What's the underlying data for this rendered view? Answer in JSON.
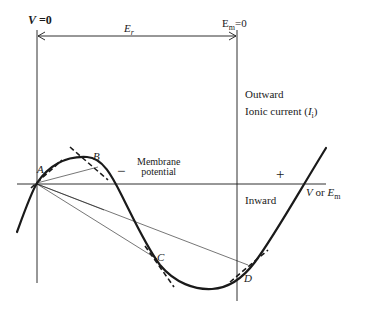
{
  "diagram": {
    "title": "",
    "labels": {
      "v_zero": "V =0",
      "v_zero_symbol": "V",
      "v_zero_rest": " =0",
      "em_zero_main": "E",
      "em_zero_sub": "m",
      "em_zero_rest": "=0",
      "er_main": "E",
      "er_sub": "r",
      "outward": "Outward",
      "ionic_current_prefix": "Ionic current (",
      "ionic_current_symbol": "I",
      "ionic_current_sub": "i",
      "ionic_current_suffix": ")",
      "inward": "Inward",
      "minus_sign": "−",
      "plus_sign": "+",
      "membrane_line1": "Membrane",
      "membrane_line2": "potential",
      "axis_v": "V",
      "axis_or": " or ",
      "axis_em_main": "E",
      "axis_em_sub": "m",
      "point_a": "A",
      "point_b": "B",
      "point_c": "C",
      "point_d": "D"
    },
    "points": [
      {
        "name": "A",
        "x": 37,
        "y": 183
      },
      {
        "name": "B",
        "x": 98,
        "y": 165
      },
      {
        "name": "C",
        "x": 157,
        "y": 258
      },
      {
        "name": "D",
        "x": 249,
        "y": 266
      }
    ],
    "colors": {
      "ink": "#1a1a1a",
      "background": "#ffffff"
    }
  }
}
